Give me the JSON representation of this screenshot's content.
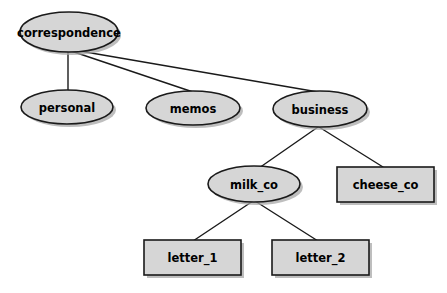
{
  "diagram": {
    "type": "tree-diagram",
    "canvas": {
      "width": 447,
      "height": 293,
      "background": "#ffffff"
    },
    "style": {
      "node_fill": "#d6d6d6",
      "node_stroke": "#1a1a1a",
      "shadow_fill": "#a8a8a8",
      "edge_stroke": "#1a1a1a",
      "label_color": "#000000"
    },
    "nodes": [
      {
        "id": "correspondence",
        "label": "correspondence",
        "shape": "ellipse",
        "cx": 69,
        "cy": 32,
        "rx": 49,
        "ry": 20
      },
      {
        "id": "personal",
        "label": "personal",
        "shape": "ellipse",
        "cx": 67,
        "cy": 107,
        "rx": 46,
        "ry": 17
      },
      {
        "id": "memos",
        "label": "memos",
        "shape": "ellipse",
        "cx": 193,
        "cy": 108,
        "rx": 47,
        "ry": 17
      },
      {
        "id": "business",
        "label": "business",
        "shape": "ellipse",
        "cx": 320,
        "cy": 109,
        "rx": 47,
        "ry": 18
      },
      {
        "id": "milk_co",
        "label": "milk_co",
        "shape": "ellipse",
        "cx": 254,
        "cy": 184,
        "rx": 46,
        "ry": 18
      },
      {
        "id": "cheese_co",
        "label": "cheese_co",
        "shape": "rect",
        "x": 337,
        "y": 167,
        "width": 97,
        "height": 35
      },
      {
        "id": "letter_1",
        "label": "letter_1",
        "shape": "rect",
        "x": 144,
        "y": 240,
        "width": 97,
        "height": 35
      },
      {
        "id": "letter_2",
        "label": "letter_2",
        "shape": "rect",
        "x": 272,
        "y": 240,
        "width": 97,
        "height": 35
      }
    ],
    "edges": [
      {
        "from": "correspondence",
        "to": "personal",
        "x1": 68,
        "y1": 51,
        "x2": 68,
        "y2": 91
      },
      {
        "from": "correspondence",
        "to": "memos",
        "x1": 68,
        "y1": 50,
        "x2": 193,
        "y2": 92
      },
      {
        "from": "correspondence",
        "to": "business",
        "x1": 68,
        "y1": 49,
        "x2": 318,
        "y2": 92
      },
      {
        "from": "business",
        "to": "milk_co",
        "x1": 318,
        "y1": 127,
        "x2": 259,
        "y2": 168
      },
      {
        "from": "business",
        "to": "cheese_co",
        "x1": 319,
        "y1": 127,
        "x2": 383,
        "y2": 167
      },
      {
        "from": "milk_co",
        "to": "letter_1",
        "x1": 253,
        "y1": 201,
        "x2": 193,
        "y2": 241
      },
      {
        "from": "milk_co",
        "to": "letter_2",
        "x1": 255,
        "y1": 201,
        "x2": 318,
        "y2": 241
      }
    ]
  }
}
